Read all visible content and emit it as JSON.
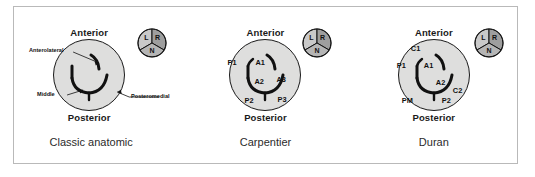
{
  "figure": {
    "orientation": {
      "anterior": "Anterior",
      "posterior": "Posterior"
    },
    "colors": {
      "annulus_fill": "#dededd",
      "leaflet_stroke": "#111111",
      "aortic_left_fill": "#c9c9c9",
      "aortic_right_fill": "#9e9e9e",
      "aortic_non_fill": "#b5b5b5",
      "frame_border": "#b9b9b9",
      "text": "#1a1a1a"
    },
    "aortic_valve": {
      "left_cusp": "L",
      "right_cusp": "R",
      "noncoronary_cusp": "N"
    }
  },
  "panels": [
    {
      "id": "classic-anatomic",
      "caption": "Classic anatomic",
      "anterior": "Anterior",
      "posterior": "Posterior",
      "aortic": {
        "left_cusp": "L",
        "right_cusp": "R",
        "noncoronary_cusp": "N"
      },
      "annotations": [
        {
          "name": "anterolateral",
          "label": "Anterolateral"
        },
        {
          "name": "middle",
          "label": "Middle"
        },
        {
          "name": "posteromedial",
          "label": "Posteromedial"
        }
      ],
      "segments": []
    },
    {
      "id": "carpentier",
      "caption": "Carpentier",
      "anterior": "Anterior",
      "posterior": "Posterior",
      "aortic": {
        "left_cusp": "L",
        "right_cusp": "R",
        "noncoronary_cusp": "N"
      },
      "annotations": [],
      "segments": [
        {
          "name": "p1",
          "label": "P1"
        },
        {
          "name": "a1",
          "label": "A1"
        },
        {
          "name": "a2",
          "label": "A2"
        },
        {
          "name": "a3",
          "label": "A3"
        },
        {
          "name": "p2",
          "label": "P2"
        },
        {
          "name": "p3",
          "label": "P3"
        }
      ]
    },
    {
      "id": "duran",
      "caption": "Duran",
      "anterior": "Anterior",
      "posterior": "Posterior",
      "aortic": {
        "left_cusp": "L",
        "right_cusp": "R",
        "noncoronary_cusp": "N"
      },
      "annotations": [],
      "segments": [
        {
          "name": "c1",
          "label": "C1"
        },
        {
          "name": "p1",
          "label": "P1"
        },
        {
          "name": "a1",
          "label": "A1"
        },
        {
          "name": "a2",
          "label": "A2"
        },
        {
          "name": "c2",
          "label": "C2"
        },
        {
          "name": "pm",
          "label": "PM"
        },
        {
          "name": "p2",
          "label": "P2"
        }
      ]
    }
  ]
}
